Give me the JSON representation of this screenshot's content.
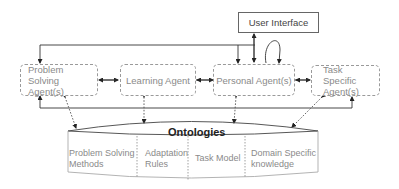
{
  "diagram": {
    "user_interface": "User Interface",
    "agents": {
      "problem_solving": "Problem Solving Agent(s)",
      "learning": "Learning Agent",
      "personal": "Personal Agent(s)",
      "task_specific": "Task Specific Agent(s)"
    },
    "ontologies": {
      "title": "Ontologies",
      "sections": [
        "Problem Solving Methods",
        "Adaptation Rules",
        "Task Model",
        "Domain Specific knowledge"
      ]
    }
  }
}
